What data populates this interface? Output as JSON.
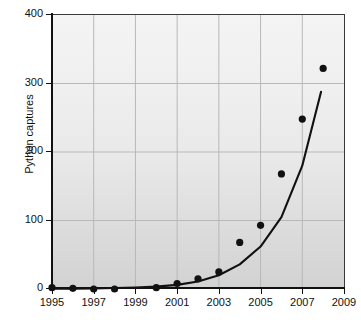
{
  "chart_data": {
    "type": "scatter",
    "title": "",
    "subtitle": "",
    "xlabel": "",
    "ylabel": "Python captures",
    "xlim": [
      1995,
      2009
    ],
    "ylim": [
      0,
      400
    ],
    "grid": true,
    "legend": null,
    "x_ticks": [
      "1995",
      "1997",
      "1999",
      "2001",
      "2003",
      "2005",
      "2007",
      "2009"
    ],
    "x_tick_values": [
      1995,
      1997,
      1999,
      2001,
      2003,
      2005,
      2007,
      2009
    ],
    "y_ticks": [
      "0",
      "100",
      "200",
      "300",
      "400"
    ],
    "y_tick_values": [
      0,
      100,
      200,
      300,
      400
    ],
    "x": [
      1995,
      1996,
      1997,
      1998,
      2000,
      2001,
      2002,
      2003,
      2004,
      2005,
      2006,
      2007,
      2008
    ],
    "values": [
      2,
      1,
      0,
      0,
      2,
      8,
      15,
      25,
      68,
      93,
      168,
      248,
      322
    ],
    "series": [
      {
        "name": "Python captures",
        "marker": "filled-circle",
        "color": "#111111",
        "x": [
          1995,
          1996,
          1997,
          1998,
          2000,
          2001,
          2002,
          2003,
          2004,
          2005,
          2006,
          2007,
          2008
        ],
        "values": [
          2,
          1,
          0,
          0,
          2,
          8,
          15,
          25,
          68,
          93,
          168,
          248,
          322
        ]
      },
      {
        "name": "exponential fit",
        "marker": "none",
        "style": "line",
        "color": "#111111",
        "x": [
          1995,
          1996,
          1997,
          1998,
          1999,
          2000,
          2001,
          2002,
          2003,
          2004,
          2005,
          2006,
          2007,
          2007.9
        ],
        "values": [
          0.4,
          0.6,
          0.9,
          1.4,
          2.2,
          3.4,
          6,
          11,
          20,
          36,
          62,
          105,
          180,
          288
        ]
      }
    ],
    "plot_bg_gradient": [
      "#f4f4f4",
      "#d2d2d2"
    ],
    "gridline_color": "#b8b8b8",
    "axis_color": "#111111"
  }
}
